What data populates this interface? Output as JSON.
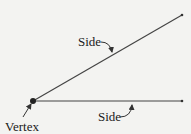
{
  "diagram": {
    "labels": {
      "side_upper": "Side",
      "side_lower": "Side",
      "vertex": "Vertex"
    },
    "colors": {
      "background": "#f3f3f1",
      "stroke": "#333333",
      "text": "#1a1a1a"
    }
  }
}
